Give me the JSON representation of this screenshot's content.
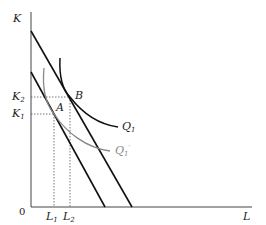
{
  "diagram": {
    "type": "isoquant-isocost",
    "axes": {
      "y_label": "K",
      "x_label": "L",
      "origin_label": "0"
    },
    "points": {
      "A": {
        "label": "A"
      },
      "B": {
        "label": "B"
      }
    },
    "ticks": {
      "K1": {
        "base": "K",
        "sub": "1"
      },
      "K2": {
        "base": "K",
        "sub": "2"
      },
      "L1": {
        "base": "L",
        "sub": "1"
      },
      "L2": {
        "base": "L",
        "sub": "2"
      }
    },
    "curves": {
      "Q1": {
        "base": "Q",
        "sub": "1",
        "color": "#111111"
      },
      "Q1_prime": {
        "base": "Q",
        "sub": "1",
        "prime": "′",
        "color": "#888888"
      }
    },
    "lines": {
      "outer_isocost": {
        "color": "#111111"
      },
      "inner_isocost": {
        "color": "#111111"
      }
    }
  }
}
